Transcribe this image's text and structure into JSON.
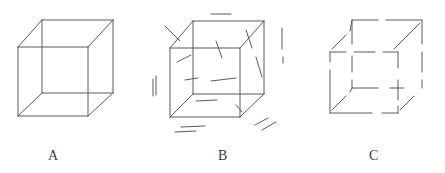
{
  "figure": {
    "background_color": "#ffffff",
    "stroke_color": "#5a5a5a",
    "stroke_width": 1,
    "width": 445,
    "height": 173
  },
  "labels": {
    "a": "A",
    "b": "B",
    "c": "C"
  },
  "cubes": [
    {
      "id": "cube-a",
      "label": "A",
      "description": "complete continuous wireframe cube",
      "vertices": {
        "front_top_left": [
          18,
          47
        ],
        "front_top_right": [
          88,
          47
        ],
        "front_bottom_left": [
          18,
          116
        ],
        "front_bottom_right": [
          88,
          116
        ],
        "back_top_left": [
          42,
          20
        ],
        "back_top_right": [
          113,
          20
        ],
        "back_bottom_left": [
          42,
          93
        ],
        "back_bottom_right": [
          113,
          93
        ]
      },
      "edges": [
        [
          [
            18,
            47
          ],
          [
            88,
            47
          ]
        ],
        [
          [
            88,
            47
          ],
          [
            88,
            116
          ]
        ],
        [
          [
            88,
            116
          ],
          [
            18,
            116
          ]
        ],
        [
          [
            18,
            116
          ],
          [
            18,
            47
          ]
        ],
        [
          [
            42,
            20
          ],
          [
            113,
            20
          ]
        ],
        [
          [
            113,
            20
          ],
          [
            113,
            93
          ]
        ],
        [
          [
            113,
            93
          ],
          [
            42,
            93
          ]
        ],
        [
          [
            42,
            93
          ],
          [
            42,
            20
          ]
        ],
        [
          [
            18,
            47
          ],
          [
            42,
            20
          ]
        ],
        [
          [
            88,
            47
          ],
          [
            113,
            20
          ]
        ],
        [
          [
            88,
            116
          ],
          [
            113,
            93
          ]
        ],
        [
          [
            18,
            116
          ],
          [
            42,
            93
          ]
        ]
      ]
    },
    {
      "id": "cube-b",
      "label": "B",
      "description": "complete wireframe cube surrounded by scattered distractor line segments",
      "vertices": {
        "front_top_left": [
          170,
          48
        ],
        "front_top_right": [
          240,
          48
        ],
        "front_bottom_left": [
          170,
          117
        ],
        "front_bottom_right": [
          240,
          117
        ],
        "back_top_left": [
          193,
          21
        ],
        "back_top_right": [
          264,
          21
        ],
        "back_bottom_left": [
          193,
          94
        ],
        "back_bottom_right": [
          264,
          94
        ]
      },
      "edges": [
        [
          [
            170,
            48
          ],
          [
            240,
            48
          ]
        ],
        [
          [
            240,
            48
          ],
          [
            240,
            117
          ]
        ],
        [
          [
            240,
            117
          ],
          [
            170,
            117
          ]
        ],
        [
          [
            170,
            117
          ],
          [
            170,
            48
          ]
        ],
        [
          [
            193,
            21
          ],
          [
            264,
            21
          ]
        ],
        [
          [
            264,
            21
          ],
          [
            264,
            94
          ]
        ],
        [
          [
            264,
            94
          ],
          [
            193,
            94
          ]
        ],
        [
          [
            193,
            94
          ],
          [
            193,
            21
          ]
        ],
        [
          [
            170,
            48
          ],
          [
            193,
            21
          ]
        ],
        [
          [
            240,
            48
          ],
          [
            264,
            21
          ]
        ],
        [
          [
            240,
            117
          ],
          [
            264,
            94
          ]
        ],
        [
          [
            170,
            117
          ],
          [
            193,
            94
          ]
        ]
      ],
      "noise_segments": [
        [
          [
            211,
            14
          ],
          [
            231,
            14
          ]
        ],
        [
          [
            165,
            26
          ],
          [
            180,
            41
          ]
        ],
        [
          [
            216,
            41
          ],
          [
            222,
            58
          ]
        ],
        [
          [
            246,
            30
          ],
          [
            252,
            48
          ]
        ],
        [
          [
            282,
            28
          ],
          [
            282,
            49
          ]
        ],
        [
          [
            283,
            57
          ],
          [
            283,
            63
          ]
        ],
        [
          [
            177,
            62
          ],
          [
            191,
            55
          ]
        ],
        [
          [
            211,
            81
          ],
          [
            236,
            78
          ]
        ],
        [
          [
            185,
            80
          ],
          [
            198,
            78
          ]
        ],
        [
          [
            256,
            57
          ],
          [
            262,
            77
          ]
        ],
        [
          [
            156,
            76
          ],
          [
            156,
            95
          ]
        ],
        [
          [
            153,
            79
          ],
          [
            153,
            96
          ]
        ],
        [
          [
            196,
            101
          ],
          [
            217,
            100
          ]
        ],
        [
          [
            236,
            105
          ],
          [
            242,
            112
          ]
        ],
        [
          [
            181,
            127
          ],
          [
            205,
            126
          ]
        ],
        [
          [
            175,
            132
          ],
          [
            196,
            131
          ]
        ],
        [
          [
            255,
            125
          ],
          [
            268,
            118
          ]
        ],
        [
          [
            262,
            130
          ],
          [
            276,
            122
          ]
        ]
      ]
    },
    {
      "id": "cube-c",
      "label": "C",
      "description": "wireframe cube with broken edges and gaps near vertices",
      "vertices": {
        "front_top_left": [
          330,
          52
        ],
        "front_top_right": [
          398,
          52
        ],
        "front_bottom_left": [
          330,
          113
        ],
        "front_bottom_right": [
          398,
          113
        ],
        "back_top_left": [
          352,
          20
        ],
        "back_top_right": [
          422,
          20
        ],
        "back_bottom_left": [
          352,
          88
        ],
        "back_bottom_right": [
          422,
          88
        ]
      },
      "edge_fragments": [
        [
          [
            330,
            52
          ],
          [
            346,
            52
          ]
        ],
        [
          [
            354,
            52
          ],
          [
            375,
            52
          ]
        ],
        [
          [
            383,
            52
          ],
          [
            398,
            52
          ]
        ],
        [
          [
            398,
            52
          ],
          [
            398,
            68
          ]
        ],
        [
          [
            398,
            80
          ],
          [
            398,
            100
          ]
        ],
        [
          [
            398,
            106
          ],
          [
            398,
            113
          ]
        ],
        [
          [
            330,
            113
          ],
          [
            372,
            113
          ]
        ],
        [
          [
            382,
            113
          ],
          [
            398,
            113
          ]
        ],
        [
          [
            330,
            52
          ],
          [
            330,
            62
          ]
        ],
        [
          [
            330,
            70
          ],
          [
            330,
            113
          ]
        ],
        [
          [
            352,
            20
          ],
          [
            378,
            20
          ]
        ],
        [
          [
            386,
            20
          ],
          [
            422,
            20
          ]
        ],
        [
          [
            422,
            20
          ],
          [
            422,
            44
          ]
        ],
        [
          [
            422,
            52
          ],
          [
            422,
            72
          ]
        ],
        [
          [
            422,
            80
          ],
          [
            422,
            88
          ]
        ],
        [
          [
            352,
            88
          ],
          [
            378,
            88
          ]
        ],
        [
          [
            390,
            88
          ],
          [
            404,
            88
          ]
        ],
        [
          [
            352,
            20
          ],
          [
            352,
            44
          ]
        ],
        [
          [
            352,
            56
          ],
          [
            352,
            72
          ]
        ],
        [
          [
            352,
            80
          ],
          [
            352,
            88
          ]
        ],
        [
          [
            332,
            49
          ],
          [
            346,
            35
          ]
        ],
        [
          [
            350,
            31
          ],
          [
            352,
            20
          ]
        ],
        [
          [
            394,
            49
          ],
          [
            420,
            23
          ]
        ],
        [
          [
            400,
            110
          ],
          [
            414,
            96
          ]
        ],
        [
          [
            332,
            110
          ],
          [
            346,
            96
          ]
        ],
        [
          [
            350,
            92
          ],
          [
            352,
            88
          ]
        ]
      ]
    }
  ]
}
